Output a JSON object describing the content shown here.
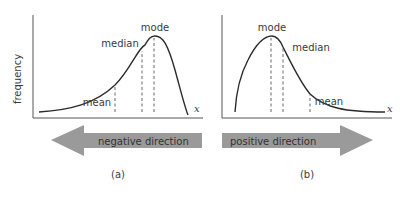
{
  "y_axis_label": "frequency",
  "panels": [
    {
      "id": "a",
      "caption": "(a)",
      "x_label": "x",
      "labels": {
        "mode": "mode",
        "median": "median",
        "mean": "mean"
      },
      "direction_label": "negative direction",
      "skew": "negative"
    },
    {
      "id": "b",
      "caption": "(b)",
      "x_label": "x",
      "labels": {
        "mode": "mode",
        "median": "median",
        "mean": "mean"
      },
      "direction_label": "positive direction",
      "skew": "positive"
    }
  ],
  "colors": {
    "curve": "#2b2b2b",
    "axis": "#555555",
    "arrow": "#9a9a9a",
    "dash": "#555555"
  }
}
